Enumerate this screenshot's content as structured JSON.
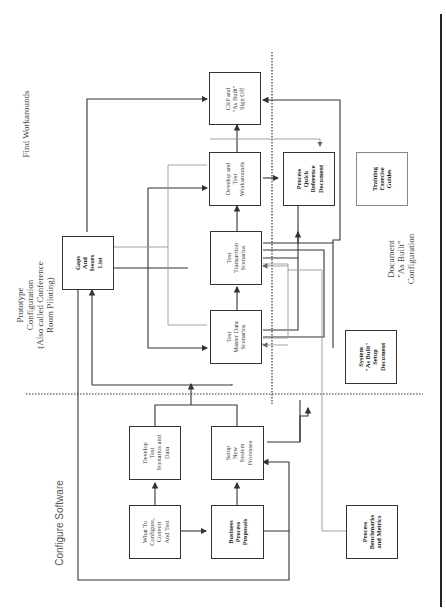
{
  "diagram": {
    "orientation": "rotated-90-ccw",
    "phases": [
      {
        "id": "configure",
        "label": "Configure Software"
      },
      {
        "id": "prototype",
        "label": "Prototype\nConfiguration\n(Also called Conference\nRoom Piloting)"
      },
      {
        "id": "find",
        "label": "Find Workarounds"
      },
      {
        "id": "document",
        "label": "Document\n\"As Built\"\nConfiguration"
      }
    ],
    "boxes": {
      "what_to_configure": {
        "label": "What To\nConfigure,\nConvert\nAnd Test",
        "bold": false
      },
      "business_process": {
        "label": "Business\nProcess\nProposals",
        "bold": true
      },
      "develop_test_scenarios": {
        "label": "Develop\nTest\nScenarios and\nData",
        "bold": false
      },
      "setup_new_system": {
        "label": "Setup\nNew\nSystem\nProcesses",
        "bold": false
      },
      "test_master_data": {
        "label": "Test\nMaster Data\nScenarios",
        "bold": false
      },
      "test_transaction": {
        "label": "Test\nTransaction\nScenarios",
        "bold": false
      },
      "develop_workarounds": {
        "label": "Develop and\nTest\nWorkarounds",
        "bold": false
      },
      "crp_signoff": {
        "label": "CRP and\n\"As Built\"\nSign Off",
        "bold": false
      },
      "gaps_issues": {
        "label": "Gaps\nAnd\nIssues\nList",
        "bold": true
      },
      "process_quick_ref": {
        "label": "Process\nQuick\nReference\nDocument",
        "bold": true
      },
      "training_guides": {
        "label": "Training\nExercise\nGuides",
        "bold": true
      },
      "system_as_built": {
        "label": "System\n\"As Built\"\nSetup\nDocument",
        "bold": true
      },
      "benchmarks": {
        "label": "Process\nBenchmarks\nand Metrics",
        "bold": true
      }
    },
    "colors": {
      "line": "#333333",
      "light_line": "#999999",
      "divider": "#222222"
    }
  }
}
